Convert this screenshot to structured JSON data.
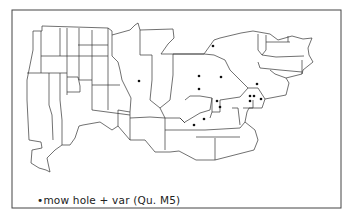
{
  "map": {
    "frame": {
      "x": 12,
      "y": 10,
      "width": 329,
      "height": 198
    },
    "line_color": "#333333",
    "dot_color": "#111111",
    "points": [
      {
        "x": 213,
        "y": 46
      },
      {
        "x": 139,
        "y": 81
      },
      {
        "x": 199,
        "y": 76
      },
      {
        "x": 221,
        "y": 77
      },
      {
        "x": 199,
        "y": 89
      },
      {
        "x": 257,
        "y": 84
      },
      {
        "x": 250,
        "y": 96
      },
      {
        "x": 254,
        "y": 96
      },
      {
        "x": 261,
        "y": 99
      },
      {
        "x": 217,
        "y": 101
      },
      {
        "x": 220,
        "y": 107
      },
      {
        "x": 204,
        "y": 119
      },
      {
        "x": 194,
        "y": 125
      },
      {
        "x": 250,
        "y": 101
      }
    ]
  },
  "legend": {
    "text": "•mow hole + var  (Qu. M5)"
  }
}
